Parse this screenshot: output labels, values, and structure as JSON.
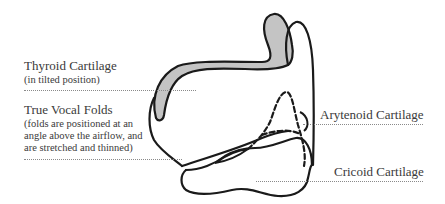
{
  "diagram": {
    "colors": {
      "outline": "#1a1a1a",
      "cartilage_fill": "#c4c4c4",
      "text": "#3a3a3a",
      "leader": "#8a8a8a"
    }
  },
  "labels": {
    "thyroid": {
      "title": "Thyroid Cartilage",
      "note": "(in tilted position)"
    },
    "vocal_folds": {
      "title": "True Vocal Folds",
      "note_lines": [
        "(folds are positioned at an",
        "angle above the airflow, and",
        "are stretched and thinned)"
      ]
    },
    "arytenoid": {
      "title": "Arytenoid Cartilage"
    },
    "cricoid": {
      "title": "Cricoid Cartilage"
    }
  }
}
